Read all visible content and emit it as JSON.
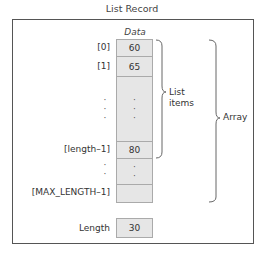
{
  "title": "List Record",
  "array": {
    "column_label": "Data",
    "rows": [
      {
        "index": "[0]",
        "value": "60"
      },
      {
        "index": "[1]",
        "value": "65"
      },
      {
        "index": "[length–1]",
        "value": "80"
      },
      {
        "index": "[MAX_LENGTH–1]",
        "value": ""
      }
    ],
    "ellipsis": "·"
  },
  "braces": {
    "list_items": "List\nitems",
    "list_items_line1": "List",
    "list_items_line2": "items",
    "array": "Array"
  },
  "length": {
    "label": "Length",
    "value": "30"
  }
}
